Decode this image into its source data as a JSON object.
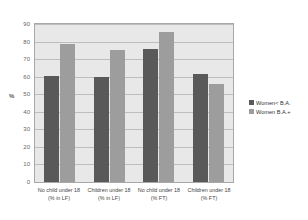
{
  "chart_data": {
    "type": "bar",
    "title": "",
    "xlabel": "",
    "ylabel": "%",
    "ylim": [
      0,
      90
    ],
    "ytick_step": 10,
    "yticks": [
      "90",
      "80",
      "70",
      "60",
      "50",
      "40",
      "30",
      "20",
      "10",
      "0"
    ],
    "grid": true,
    "legend_position": "right",
    "categories": [
      {
        "line1": "No child under 18",
        "line2": "(% in LF)"
      },
      {
        "line1": "Children under 18",
        "line2": "(% in LF)"
      },
      {
        "line1": "No child under 18",
        "line2": "(% FT)"
      },
      {
        "line1": "Children under 18",
        "line2": "(% FT)"
      }
    ],
    "series": [
      {
        "name": "Women< B.A.",
        "color": "#595959",
        "values": [
          60.5,
          60,
          75.5,
          61.5
        ]
      },
      {
        "name": "Women B.A.+",
        "color": "#9d9d9d",
        "values": [
          78.5,
          75,
          85.5,
          56
        ]
      }
    ]
  }
}
